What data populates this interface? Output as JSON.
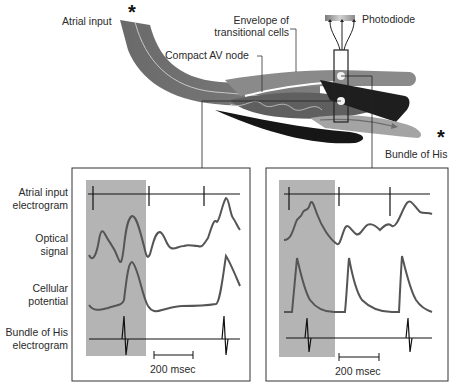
{
  "anatomy": {
    "labels": {
      "atrial_input": "Atrial input",
      "envelope": "Envelope of\ntransitional cells",
      "envelope_line1": "Envelope of",
      "envelope_line2": "transitional cells",
      "compact_av_node": "Compact AV node",
      "photodiode": "Photodiode",
      "bundle_of_his": "Bundle of His"
    },
    "markers": {
      "stimulus_star_left": "*",
      "stimulus_star_right": "*"
    },
    "colors": {
      "tissue_mid_gray": "#6e6e6e",
      "tissue_light_gray": "#9a9a9a",
      "tissue_dark": "#1c1c1c",
      "photodiode_gradient_start": "#8a8a8a",
      "photodiode_gradient_end": "#d0d0d0"
    }
  },
  "trace_labels": {
    "atrial_electrogram_1": "Atrial input",
    "atrial_electrogram_2": "electrogram",
    "optical_1": "Optical",
    "optical_2": "signal",
    "cellular_1": "Cellular",
    "cellular_2": "potential",
    "his_1": "Bundle of His",
    "his_2": "electrogram"
  },
  "panels": [
    {
      "id": "left",
      "scale_bar_label": "200 msec",
      "shaded_color": "#b4b4b4",
      "traces": [
        "atrial_electrogram",
        "optical_signal",
        "cellular_potential",
        "his_electrogram"
      ]
    },
    {
      "id": "right",
      "scale_bar_label": "200 msec",
      "shaded_color": "#b4b4b4",
      "traces": [
        "atrial_electrogram",
        "optical_signal",
        "cellular_potential",
        "his_electrogram"
      ]
    }
  ],
  "colors": {
    "trace": "#5a5a5a",
    "electrogram": "#111111",
    "panel_border": "#333333",
    "shade": "#b2b2b2"
  }
}
